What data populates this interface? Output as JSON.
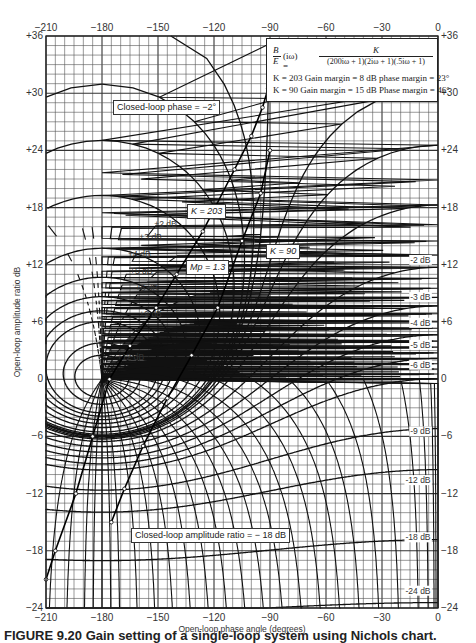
{
  "chart_data": {
    "type": "line",
    "title": "Nichols chart",
    "xlabel": "Open-loop phase angle (degrees)",
    "ylabel": "Open-loop amplitude ratio dB",
    "xlim": [
      -210,
      0
    ],
    "ylim": [
      -24,
      36
    ],
    "x_ticks": [
      "-210",
      "-180",
      "-150",
      "-120",
      "-90",
      "-60",
      "-30",
      "0"
    ],
    "y_ticks": [
      "+36",
      "+30",
      "+24",
      "+18",
      "+12",
      "+6",
      "0",
      "-6",
      "-12",
      "-18",
      "-24"
    ],
    "grid": true,
    "transfer_function": {
      "lhs_num": "B",
      "lhs_den": "E",
      "lhs_arg": "(iω) =",
      "numerator": "K",
      "denominator": "(200iω + 1)(2iω + 1)(.5iω + 1)"
    },
    "margin_notes": [
      "K = 203 Gain margin = 8 dB phase margin = 23°",
      "K = 90 Gain margin = 15 dB Phase margin = 46°"
    ],
    "closed_loop_magnitude_contours_db": [
      12,
      9,
      6,
      5,
      4,
      3,
      2,
      1,
      0.5,
      0.25,
      0.1,
      0,
      -0.25,
      -0.5,
      -1,
      -2,
      -3,
      -4,
      -5,
      -6,
      -9,
      -12,
      -18,
      -24
    ],
    "magnitude_labels": [
      {
        "text": "+0.10 dB",
        "db": 0.1
      },
      {
        "text": "+0.25 dB",
        "db": 0.25
      },
      {
        "text": "+0.5 dB",
        "db": 0.5
      },
      {
        "text": "+1.0 dB",
        "db": 1
      },
      {
        "text": "+2 dB",
        "db": 2
      },
      {
        "text": "+3 dB",
        "db": 3
      },
      {
        "text": "+4 dB",
        "db": 4
      },
      {
        "text": "+5 dB",
        "db": 5
      },
      {
        "text": "+6 dB",
        "db": 6
      },
      {
        "text": "+9 dB",
        "db": 9
      },
      {
        "text": "+12 dB",
        "db": 12
      },
      {
        "text": "0 dB",
        "db": 0
      },
      {
        "text": "-0.25 dB",
        "db": -0.25
      },
      {
        "text": "-0.5 dB",
        "db": -0.5
      },
      {
        "text": "-1.0 dB",
        "db": -1
      },
      {
        "text": "-2 dB",
        "db": -2
      },
      {
        "text": "-3 dB",
        "db": -3
      },
      {
        "text": "-4 dB",
        "db": -4
      },
      {
        "text": "-5 dB",
        "db": -5
      },
      {
        "text": "-6 dB",
        "db": -6
      },
      {
        "text": "-9 dB",
        "db": -9
      },
      {
        "text": "-12 dB",
        "db": -12
      },
      {
        "text": "-18 dB",
        "db": -18
      },
      {
        "text": "-24 dB",
        "db": -24
      }
    ],
    "closed_loop_phase_contours_deg": [
      5,
      2,
      1,
      0,
      -1,
      -2,
      -5,
      -10,
      -20,
      -30,
      -40,
      -50,
      -60,
      -70,
      -80,
      -90,
      -100,
      -110,
      -120,
      -130,
      -140,
      -150,
      -160,
      -170,
      -175,
      -180,
      -185,
      -190,
      -200,
      -210
    ],
    "phase_labels_top": [
      "+1°",
      "-1°",
      "+2°",
      "0°",
      "-2°",
      "+5°",
      "-5°",
      "+10°",
      "-10°",
      "-20°",
      "-30°",
      "-40°",
      "-50°",
      "-60°"
    ],
    "phase_labels_bottom": [
      "-210°",
      "-200°",
      "-190°",
      "-185°",
      "-180°",
      "-175°",
      "-170°",
      "-160°",
      "-150°",
      "-140°",
      "-130°",
      "-120°",
      "-110°",
      "-100°",
      "-90°",
      "-80°",
      "-70°",
      "-60°",
      "-50°",
      "-40°",
      "-30°",
      "-20°",
      "-10°",
      "-5°",
      "-2°",
      "0°"
    ],
    "series": [
      {
        "name": "K = 203",
        "frequency_points": [
          ".04",
          ".05",
          ".07",
          "0.1",
          "0.2",
          "0.3",
          "0.4",
          "0.55",
          "0.7"
        ],
        "points": [
          [
            -91,
            30.5
          ],
          [
            -94,
            28.5
          ],
          [
            -100,
            25.5
          ],
          [
            -109,
            22
          ],
          [
            -126,
            15.5
          ],
          [
            -140,
            11
          ],
          [
            -151,
            7.5
          ],
          [
            -165,
            3.5
          ],
          [
            -176,
            0
          ],
          [
            -185,
            -6
          ],
          [
            -194,
            -12
          ],
          [
            -205,
            -18
          ],
          [
            -210,
            -21
          ]
        ]
      },
      {
        "name": "K = 90",
        "points": [
          [
            -90,
            24
          ],
          [
            -95,
            19.5
          ],
          [
            -105,
            14.5
          ],
          [
            -118,
            7.5
          ],
          [
            -132,
            2.5
          ],
          [
            -145,
            -2
          ],
          [
            -158,
            -7
          ],
          [
            -168,
            -11.5
          ],
          [
            -175,
            -15
          ]
        ]
      }
    ],
    "annotations": [
      "Closed-loop phase = -2°",
      "K = 203",
      "K = 90",
      "Mp = 1.3",
      "ω = 0.7",
      "Closed-loop amplitude ratio = -18 dB"
    ],
    "frequency_labels": [
      ".04",
      ".05",
      ".07",
      "0.1",
      "0.2",
      "0.3",
      "0.4",
      "0.55",
      "ω = 0.7"
    ]
  },
  "annotations": {
    "phase_box": "Closed-loop phase = −2°",
    "k203_box": "K = 203",
    "k90_box": "K = 90",
    "mp_box": "Mp = 1.3",
    "amp_box": "Closed-loop amplitude ratio = − 18 dB"
  },
  "caption": "FIGURE 9.20   Gain setting of a single-loop system using Nichols chart."
}
